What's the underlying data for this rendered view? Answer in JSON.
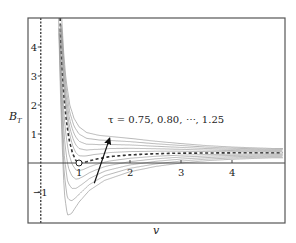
{
  "chart_data": {
    "type": "line",
    "title": "",
    "xlabel": "v",
    "ylabel": "B_T",
    "ylabel_main": "B",
    "ylabel_sub": "T",
    "xlim": [
      0,
      5.0
    ],
    "ylim": [
      -2.05,
      5.0
    ],
    "x_ticks": [
      1,
      2,
      3,
      4
    ],
    "x_tick_labels": [
      "1",
      "2",
      "3",
      "4"
    ],
    "y_ticks": [
      -1,
      1,
      2,
      3,
      4
    ],
    "y_tick_labels": [
      "−1",
      "1",
      "2",
      "3",
      "4"
    ],
    "grid": false,
    "legend": null,
    "horizontal_line_y": 0,
    "vertical_dashed_x": 0.25,
    "annotation": {
      "text": "τ = 0.75, 0.80, ⋯, 1.25",
      "arrow_from": [
        1.3,
        -0.7
      ],
      "arrow_to": [
        1.6,
        0.85
      ]
    },
    "critical_point": {
      "v": 1.0,
      "B": 0.0,
      "marker": "open-circle"
    },
    "tau_values": [
      0.75,
      0.8,
      0.85,
      0.9,
      0.95,
      1.0,
      1.05,
      1.1,
      1.15,
      1.2,
      1.25
    ],
    "dashed_series_tau": 1.0,
    "anchor_series": [
      {
        "name": "tau=0.75",
        "tau": 0.75,
        "v": [
          0.6,
          0.63,
          0.67,
          0.71,
          0.77,
          0.85,
          1.0,
          1.2,
          1.5,
          2.0,
          2.5,
          3.0,
          3.5,
          4.0,
          4.8
        ],
        "B": [
          5.0,
          2.8,
          0.6,
          -1.0,
          -1.8,
          -1.75,
          -1.35,
          -0.95,
          -0.6,
          -0.3,
          -0.12,
          0.0,
          0.08,
          0.13,
          0.18
        ]
      },
      {
        "name": "tau=1.00",
        "tau": 1.0,
        "v": [
          0.63,
          0.66,
          0.7,
          0.75,
          0.8,
          0.87,
          0.94,
          1.0,
          1.1,
          1.3,
          1.6,
          2.0,
          2.5,
          3.0,
          4.0,
          4.8
        ],
        "B": [
          5.0,
          3.6,
          2.4,
          1.5,
          0.85,
          0.35,
          0.08,
          0.0,
          0.02,
          0.12,
          0.22,
          0.28,
          0.32,
          0.34,
          0.35,
          0.35
        ]
      },
      {
        "name": "tau=1.25",
        "tau": 1.25,
        "v": [
          0.66,
          0.7,
          0.75,
          0.82,
          0.9,
          1.0,
          1.15,
          1.4,
          1.7,
          2.0,
          2.5,
          3.0,
          3.5,
          4.0,
          4.8
        ],
        "B": [
          5.0,
          3.8,
          2.8,
          2.0,
          1.55,
          1.25,
          1.05,
          0.95,
          0.9,
          0.85,
          0.75,
          0.67,
          0.6,
          0.55,
          0.5
        ]
      }
    ],
    "colors": {
      "frame": "#555555",
      "curve": "#9a9a9a",
      "dashed": "#333333",
      "axis": "#444444",
      "arrow": "#111111"
    }
  }
}
